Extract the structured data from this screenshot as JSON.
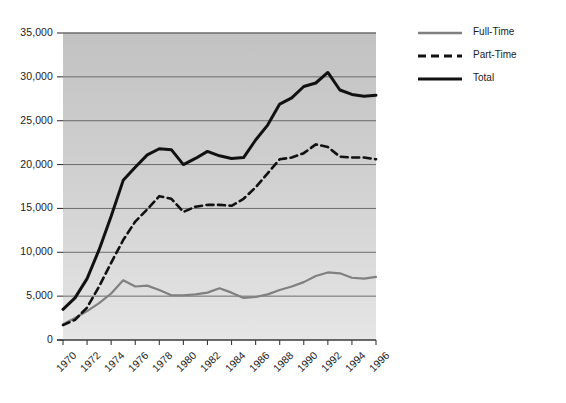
{
  "chart_data": {
    "type": "line",
    "title": "",
    "subtitle": "",
    "xlabel": "",
    "ylabel": "",
    "x": [
      1970,
      1971,
      1972,
      1973,
      1974,
      1975,
      1976,
      1977,
      1978,
      1979,
      1980,
      1981,
      1982,
      1983,
      1984,
      1985,
      1986,
      1987,
      1988,
      1989,
      1990,
      1991,
      1992,
      1993,
      1994,
      1995,
      1996
    ],
    "xlim": [
      1970,
      1996
    ],
    "ylim": [
      0,
      35000
    ],
    "grid": true,
    "grid_axis": "y",
    "legend_position": "right",
    "series": [
      {
        "name": "Full-Time",
        "color": "#808080",
        "style": "solid",
        "width": 2.2,
        "values": [
          1800,
          2500,
          3300,
          4200,
          5300,
          6800,
          6100,
          6200,
          5700,
          5100,
          5100,
          5200,
          5400,
          5900,
          5400,
          4800,
          4900,
          5200,
          5700,
          6100,
          6600,
          7300,
          7700,
          7600,
          7100,
          7000,
          7200
        ]
      },
      {
        "name": "Part-Time",
        "color": "#111111",
        "style": "dashed",
        "width": 2.6,
        "values": [
          1700,
          2300,
          3700,
          6100,
          8800,
          11400,
          13500,
          14900,
          16400,
          16100,
          14600,
          15200,
          15400,
          15400,
          15300,
          16100,
          17400,
          19000,
          20600,
          20800,
          21300,
          22300,
          22000,
          20900,
          20800,
          20800,
          20600
        ]
      },
      {
        "name": "Total",
        "color": "#111111",
        "style": "solid",
        "width": 3.0,
        "values": [
          3500,
          4800,
          7000,
          10300,
          14100,
          18200,
          19700,
          21100,
          21800,
          21700,
          20000,
          20700,
          21500,
          21000,
          20700,
          20800,
          22800,
          24500,
          26900,
          27600,
          28900,
          29300,
          30500,
          28500,
          28000,
          27800,
          27900
        ]
      }
    ],
    "yticks": [
      {
        "value": 0,
        "label": "0"
      },
      {
        "value": 5000,
        "label": "5,000"
      },
      {
        "value": 10000,
        "label": "10,000"
      },
      {
        "value": 15000,
        "label": "15,000"
      },
      {
        "value": 20000,
        "label": "20,000"
      },
      {
        "value": 25000,
        "label": "25,000"
      },
      {
        "value": 30000,
        "label": "30,000"
      },
      {
        "value": 35000,
        "label": "35,000"
      }
    ],
    "xticks": [
      {
        "value": 1970,
        "label": "1970"
      },
      {
        "value": 1972,
        "label": "1972"
      },
      {
        "value": 1974,
        "label": "1974"
      },
      {
        "value": 1976,
        "label": "1976"
      },
      {
        "value": 1978,
        "label": "1978"
      },
      {
        "value": 1980,
        "label": "1980"
      },
      {
        "value": 1982,
        "label": "1982"
      },
      {
        "value": 1984,
        "label": "1984"
      },
      {
        "value": 1986,
        "label": "1986"
      },
      {
        "value": 1988,
        "label": "1988"
      },
      {
        "value": 1990,
        "label": "1990"
      },
      {
        "value": 1992,
        "label": "1992"
      },
      {
        "value": 1994,
        "label": "1994"
      },
      {
        "value": 1996,
        "label": "1996"
      }
    ],
    "legend": [
      {
        "label": "Full-Time",
        "color": "#808080",
        "style": "solid"
      },
      {
        "label": "Part-Time",
        "color": "#111111",
        "style": "dashed"
      },
      {
        "label": "Total",
        "color": "#111111",
        "style": "solid"
      }
    ],
    "colors": {
      "plot_background_top": "#c4c4c4",
      "plot_background_bottom": "#e3e3e3",
      "gridline": "#6b6b6b",
      "axis": "#3a3a3a",
      "text": "#1c1c1c"
    }
  }
}
